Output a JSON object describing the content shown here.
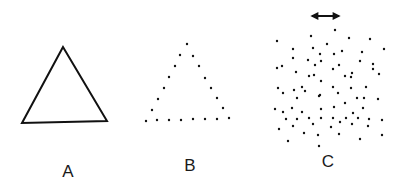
{
  "figure": {
    "panels": [
      {
        "id": "A",
        "label": "A",
        "kind": "solid-triangle",
        "vertices": [
          [
            63,
            47
          ],
          [
            22,
            123
          ],
          [
            107,
            121
          ]
        ],
        "label_pos": [
          68,
          163
        ],
        "stroke": "#111111"
      },
      {
        "id": "B",
        "label": "B",
        "kind": "dotted-triangle",
        "dots": [
          [
            187,
            44
          ],
          [
            180,
            55
          ],
          [
            193,
            56
          ],
          [
            175,
            66
          ],
          [
            199,
            66
          ],
          [
            169,
            77
          ],
          [
            205,
            78
          ],
          [
            164,
            88
          ],
          [
            211,
            88
          ],
          [
            158,
            99
          ],
          [
            217,
            98
          ],
          [
            152,
            110
          ],
          [
            223,
            108
          ],
          [
            146,
            121
          ],
          [
            157,
            120
          ],
          [
            169,
            120
          ],
          [
            181,
            120
          ],
          [
            193,
            119
          ],
          [
            205,
            119
          ],
          [
            217,
            119
          ],
          [
            229,
            118
          ]
        ],
        "label_pos": [
          190,
          157
        ]
      },
      {
        "id": "C",
        "label": "C",
        "kind": "random-dots",
        "arrow": {
          "x1": 309,
          "y1": 16,
          "x2": 342,
          "y2": 16,
          "double_headed": true
        },
        "dots": [
          [
            335,
            30
          ],
          [
            277,
            41
          ],
          [
            311,
            36
          ],
          [
            349,
            38
          ],
          [
            370,
            39
          ],
          [
            327,
            44
          ],
          [
            384,
            49
          ],
          [
            293,
            49
          ],
          [
            313,
            48
          ],
          [
            320,
            54
          ],
          [
            334,
            54
          ],
          [
            342,
            51
          ],
          [
            362,
            52
          ],
          [
            293,
            58
          ],
          [
            308,
            60
          ],
          [
            321,
            61
          ],
          [
            360,
            61
          ],
          [
            277,
            68
          ],
          [
            282,
            66
          ],
          [
            296,
            72
          ],
          [
            315,
            65
          ],
          [
            333,
            69
          ],
          [
            339,
            65
          ],
          [
            373,
            64
          ],
          [
            373,
            69
          ],
          [
            379,
            74
          ],
          [
            314,
            75
          ],
          [
            309,
            76
          ],
          [
            345,
            76
          ],
          [
            351,
            77
          ],
          [
            352,
            73
          ],
          [
            321,
            81
          ],
          [
            278,
            88
          ],
          [
            283,
            93
          ],
          [
            294,
            90
          ],
          [
            302,
            87
          ],
          [
            305,
            91
          ],
          [
            333,
            87
          ],
          [
            351,
            88
          ],
          [
            366,
            87
          ],
          [
            338,
            93
          ],
          [
            319,
            96
          ],
          [
            297,
            98
          ],
          [
            320,
            95
          ],
          [
            364,
            98
          ],
          [
            357,
            98
          ],
          [
            378,
            99
          ],
          [
            345,
            103
          ],
          [
            275,
            109
          ],
          [
            283,
            112
          ],
          [
            292,
            108
          ],
          [
            302,
            112
          ],
          [
            321,
            109
          ],
          [
            334,
            107
          ],
          [
            353,
            113
          ],
          [
            363,
            108
          ],
          [
            286,
            119
          ],
          [
            297,
            119
          ],
          [
            309,
            118
          ],
          [
            313,
            124
          ],
          [
            321,
            118
          ],
          [
            333,
            118
          ],
          [
            340,
            122
          ],
          [
            346,
            118
          ],
          [
            352,
            124
          ],
          [
            358,
            118
          ],
          [
            369,
            119
          ],
          [
            382,
            120
          ],
          [
            279,
            129
          ],
          [
            293,
            126
          ],
          [
            304,
            133
          ],
          [
            318,
            135
          ],
          [
            331,
            127
          ],
          [
            339,
            134
          ],
          [
            368,
            126
          ],
          [
            382,
            135
          ],
          [
            288,
            141
          ],
          [
            319,
            146
          ],
          [
            360,
            139
          ]
        ],
        "label_pos": [
          328,
          153
        ]
      }
    ],
    "colors": {
      "ink": "#111111",
      "background": "#ffffff"
    }
  }
}
